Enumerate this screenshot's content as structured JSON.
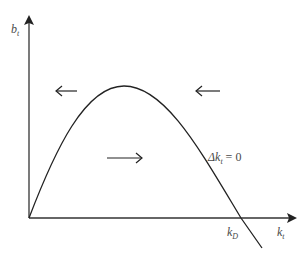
{
  "diagram": {
    "type": "phase-diagram",
    "y_axis_label": "b",
    "y_axis_sub": "t",
    "x_axis_label": "k",
    "x_axis_sub": "t",
    "curve_label_prefix": "Δk",
    "curve_label_sub": "t",
    "curve_label_suffix": " = 0",
    "intercept_label": "k",
    "intercept_sub": "D",
    "arrows": [
      {
        "direction": "left",
        "region": "upper-left"
      },
      {
        "direction": "left",
        "region": "upper-right"
      },
      {
        "direction": "right",
        "region": "under-curve"
      }
    ],
    "colors": {
      "line": "#222222",
      "text": "#4a4a4a"
    }
  }
}
